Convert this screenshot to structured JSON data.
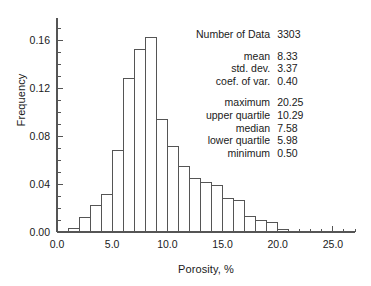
{
  "chart_data": {
    "type": "bar",
    "title": "",
    "xlabel": "Porosity, %",
    "ylabel": "Frequency",
    "xlim": [
      0,
      27
    ],
    "ylim": [
      0,
      0.175
    ],
    "grid": false,
    "legend": null,
    "bin_width": 1.0,
    "x_major_ticks": [
      0,
      5,
      10,
      15,
      20,
      25
    ],
    "x_major_tick_labels": [
      "0.0",
      "5.0",
      "10.0",
      "15.0",
      "20.0",
      "25.0"
    ],
    "x_minor_tick_step": 1.0,
    "y_major_ticks": [
      0.0,
      0.04,
      0.08,
      0.12,
      0.16
    ],
    "y_major_tick_labels": [
      "0.00",
      "0.04",
      "0.08",
      "0.12",
      "0.16"
    ],
    "y_minor_tick_step": 0.01,
    "bin_starts": [
      1,
      2,
      3,
      4,
      5,
      6,
      7,
      8,
      9,
      10,
      11,
      12,
      13,
      14,
      15,
      16,
      17,
      18,
      19,
      20
    ],
    "values": [
      0.003,
      0.012,
      0.022,
      0.031,
      0.068,
      0.128,
      0.152,
      0.162,
      0.094,
      0.071,
      0.055,
      0.045,
      0.041,
      0.039,
      0.028,
      0.026,
      0.013,
      0.01,
      0.008,
      0.002
    ],
    "bar_facecolor": "#ffffff",
    "bar_edgecolor": "#555555",
    "axis_color": "#555555",
    "text_color": "#1a1a1a"
  },
  "stats": {
    "number_of_data_label": "Number of Data",
    "number_of_data_value": "3303",
    "rows": [
      {
        "label": "mean",
        "value": "8.33"
      },
      {
        "label": "std. dev.",
        "value": "3.37"
      },
      {
        "label": "coef. of var.",
        "value": "0.40"
      }
    ],
    "rows2": [
      {
        "label": "maximum",
        "value": "20.25"
      },
      {
        "label": "upper quartile",
        "value": "10.29"
      },
      {
        "label": "median",
        "value": "7.58"
      },
      {
        "label": "lower quartile",
        "value": "5.98"
      },
      {
        "label": "minimum",
        "value": "0.50"
      }
    ]
  }
}
